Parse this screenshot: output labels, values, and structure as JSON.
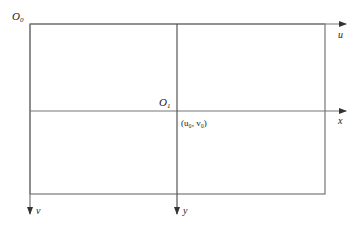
{
  "diagram": {
    "colors": {
      "line": "#555555",
      "text": "#222222",
      "background": "#ffffff"
    },
    "labels": {
      "origin_pixel": "O",
      "origin_pixel_sub": "0",
      "origin_physical": "O",
      "origin_physical_sub": "1",
      "principal_point": "(u₀, v₀)",
      "u_axis": "u",
      "v_axis": "v",
      "x_axis": "x",
      "y_axis": "y"
    },
    "geometry": {
      "rect": {
        "left": 30,
        "top": 24,
        "right": 325,
        "bottom": 194
      },
      "center": {
        "x": 177,
        "y": 111
      },
      "arrow_end_x": 346,
      "arrow_end_y": 214
    }
  }
}
